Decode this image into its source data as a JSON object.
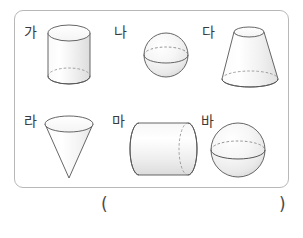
{
  "page": {
    "kind": "math-worksheet-figure"
  },
  "colors": {
    "panel_border": "#b8b8b8",
    "shape_stroke": "#555555",
    "shape_fill_light": "#fdfdfd",
    "shape_fill_shade": "#e8e8e8",
    "hidden_edge": "#7a7a7a",
    "label_text": "#3a3a3a",
    "background": "#ffffff"
  },
  "panel": {
    "shapes": [
      {
        "label": "가",
        "solid_name": "cylinder-upright",
        "row": 1,
        "column": 1
      },
      {
        "label": "나",
        "solid_name": "sphere-small",
        "row": 1,
        "column": 2
      },
      {
        "label": "다",
        "solid_name": "cone-frustum",
        "row": 1,
        "column": 3
      },
      {
        "label": "라",
        "solid_name": "cone-inverted",
        "row": 2,
        "column": 1
      },
      {
        "label": "마",
        "solid_name": "cylinder-horizontal",
        "row": 2,
        "column": 2
      },
      {
        "label": "바",
        "solid_name": "sphere-large",
        "row": 2,
        "column": 3
      }
    ]
  },
  "answer": {
    "open_paren": "(",
    "close_paren": ")",
    "value": ""
  }
}
